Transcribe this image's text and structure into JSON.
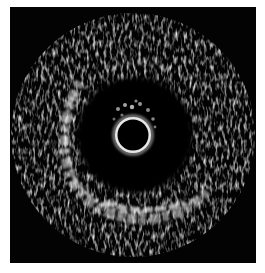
{
  "image": {
    "subject": "intravascular ultrasound cross-section",
    "background_color": "#030303",
    "page_color": "#ffffff",
    "catheter": {
      "cx": 123,
      "cy": 128,
      "lumen_radius": 16,
      "ring_radius": 20
    }
  }
}
